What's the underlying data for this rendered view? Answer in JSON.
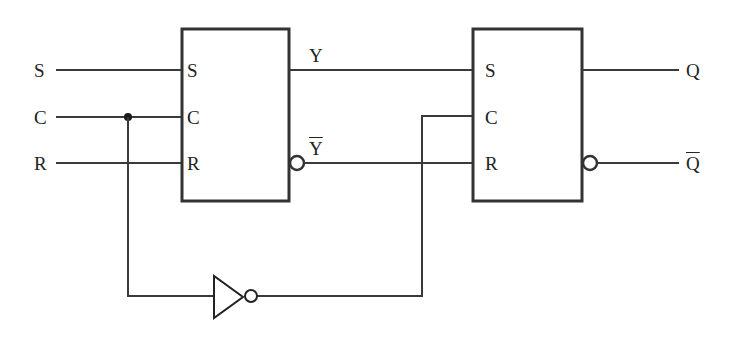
{
  "diagram": {
    "type": "master-slave SR flip-flop",
    "inputs": [
      {
        "label": "S"
      },
      {
        "label": "C"
      },
      {
        "label": "R"
      }
    ],
    "master": {
      "pins_in": [
        "S",
        "C",
        "R"
      ],
      "out_true": "Y",
      "out_inverted": "Y"
    },
    "slave": {
      "pins_in": [
        "S",
        "C",
        "R"
      ]
    },
    "outputs": [
      {
        "label": "Q"
      },
      {
        "label": "Q",
        "inverted": true
      }
    ],
    "inverter": {
      "name": "NOT gate on clock to slave"
    },
    "colors": {
      "line": "#333333",
      "background": "#ffffff"
    }
  }
}
